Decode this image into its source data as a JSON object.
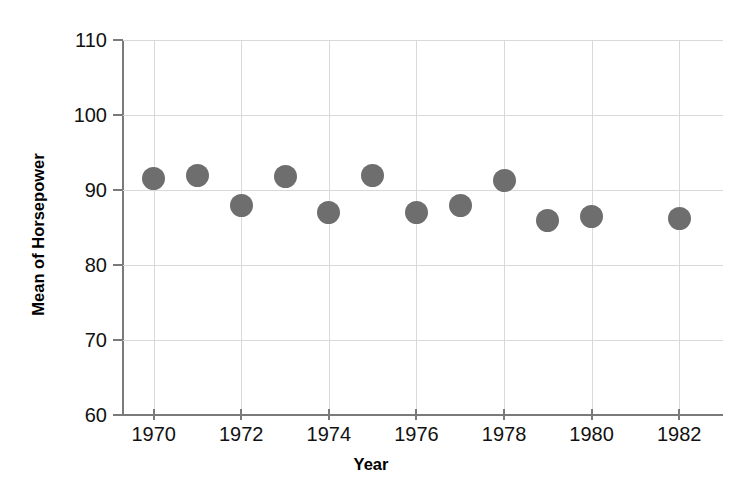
{
  "chart_data": {
    "type": "scatter",
    "title": "",
    "xlabel": "Year",
    "ylabel": "Mean of Horsepower",
    "xlim": [
      1969.3,
      1983.0
    ],
    "ylim": [
      60,
      110
    ],
    "ytick_labels": [
      "110",
      "100",
      "90",
      "80",
      "70",
      "60"
    ],
    "yticks": [
      110,
      100,
      90,
      80,
      70,
      60
    ],
    "xtick_labels": [
      "1970",
      "1972",
      "1974",
      "1976",
      "1978",
      "1980",
      "1982"
    ],
    "xticks": [
      1970,
      1972,
      1974,
      1976,
      1978,
      1980,
      1982
    ],
    "grid": true,
    "legend": "none",
    "marker": {
      "shape": "circle",
      "color": "#6e6e6e",
      "size_px": 23
    },
    "x": [
      1970,
      1971,
      1972,
      1973,
      1974,
      1975,
      1976,
      1977,
      1978,
      1979,
      1980,
      1982
    ],
    "values": [
      91.5,
      92.0,
      88.0,
      91.8,
      87.0,
      91.9,
      87.0,
      88.0,
      91.3,
      86.0,
      86.5,
      86.2
    ],
    "points": [
      {
        "year": 1970,
        "value": 91.5
      },
      {
        "year": 1971,
        "value": 92.0
      },
      {
        "year": 1972,
        "value": 88.0
      },
      {
        "year": 1973,
        "value": 91.8
      },
      {
        "year": 1974,
        "value": 87.0
      },
      {
        "year": 1975,
        "value": 91.9
      },
      {
        "year": 1976,
        "value": 87.0
      },
      {
        "year": 1977,
        "value": 88.0
      },
      {
        "year": 1978,
        "value": 91.3
      },
      {
        "year": 1979,
        "value": 86.0
      },
      {
        "year": 1980,
        "value": 86.5
      },
      {
        "year": 1982,
        "value": 86.2
      }
    ]
  }
}
